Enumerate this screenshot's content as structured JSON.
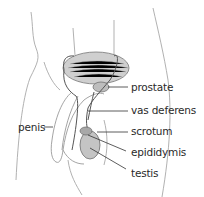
{
  "diagram": {
    "labels": [
      {
        "id": "prostate",
        "text": "prostate"
      },
      {
        "id": "vas_deferens",
        "text": "vas deferens"
      },
      {
        "id": "scrotum",
        "text": "scrotum"
      },
      {
        "id": "epididymis",
        "text": "epididymis"
      },
      {
        "id": "testis",
        "text": "testis"
      },
      {
        "id": "penis",
        "text": "penis"
      }
    ],
    "colors": {
      "outline": "#9a9a9a",
      "organ_fill": "#c9c9c9",
      "organ_stroke": "#6e6e6e",
      "duct": "#555555",
      "leader": "#333333",
      "text": "#2a2a2a"
    }
  }
}
